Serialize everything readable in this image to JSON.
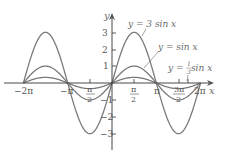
{
  "chart_data": {
    "type": "line",
    "title": "",
    "xlabel": "x",
    "ylabel": "y",
    "xlim": [
      -6.2832,
      6.2832
    ],
    "ylim": [
      -3,
      3
    ],
    "grid": false,
    "legend_position": "inline annotations",
    "x_ticks": [
      {
        "value": -6.2832,
        "label": "−2π"
      },
      {
        "value": -3.1416,
        "label": "−π"
      },
      {
        "value": -1.5708,
        "label_num": "π",
        "label_den": "2",
        "sign": "−"
      },
      {
        "value": 1.5708,
        "label_num": "π",
        "label_den": "2",
        "sign": ""
      },
      {
        "value": 3.1416,
        "label": "π"
      },
      {
        "value": 4.7124,
        "label_num": "3π",
        "label_den": "2",
        "sign": ""
      },
      {
        "value": 6.2832,
        "label": "2π"
      }
    ],
    "y_ticks": [
      {
        "value": 3,
        "label": "3"
      },
      {
        "value": 2,
        "label": "2"
      },
      {
        "value": 1,
        "label": "1"
      },
      {
        "value": -1,
        "label": "−1"
      },
      {
        "value": -2,
        "label": "−2"
      },
      {
        "value": -3,
        "label": "−3"
      }
    ],
    "x": [
      -6.2832,
      -4.7124,
      -3.1416,
      -1.5708,
      0,
      1.5708,
      3.1416,
      4.7124,
      6.2832
    ],
    "series": [
      {
        "name": "y = 3 sin x",
        "amplitude": 3,
        "values": [
          0,
          3,
          0,
          -3,
          0,
          3,
          0,
          -3,
          0
        ]
      },
      {
        "name": "y = sin x",
        "amplitude": 1,
        "values": [
          0,
          1,
          0,
          -1,
          0,
          1,
          0,
          -1,
          0
        ]
      },
      {
        "name": "y = (1/3) sin x",
        "amplitude": 0.3333,
        "values": [
          0,
          0.333,
          0,
          -0.333,
          0,
          0.333,
          0,
          -0.333,
          0
        ]
      }
    ],
    "annotations": [
      {
        "text": "y = 3 sin x",
        "series": 0
      },
      {
        "text": "y = sin x",
        "series": 1
      },
      {
        "text_prefix": "y = ",
        "frac_num": "1",
        "frac_den": "3",
        "text_suffix": " sin x",
        "series": 2
      }
    ],
    "colors": {
      "curve": "#7a7a7a",
      "axis": "#333333",
      "label": "#6a6a6a"
    }
  },
  "labels": {
    "x_axis": "x",
    "y_axis": "y",
    "ann_3sin": "y = 3 sin x",
    "ann_sin": "y = sin x",
    "ann_third_prefix": "y = ",
    "ann_third_num": "1",
    "ann_third_den": "3",
    "ann_third_suffix": " sin x",
    "xt_m2pi": "−2π",
    "xt_mpi": "−π",
    "xt_mpi2_num": "π",
    "xt_mpi2_den": "2",
    "xt_pi2_num": "π",
    "xt_pi2_den": "2",
    "xt_pi": "π",
    "xt_3pi2_num": "3π",
    "xt_3pi2_den": "2",
    "xt_2pi": "2π",
    "yt_3": "3",
    "yt_2": "2",
    "yt_1": "1",
    "yt_m1": "−1",
    "yt_m2": "−2",
    "yt_m3": "−3"
  }
}
